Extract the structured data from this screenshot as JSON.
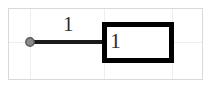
{
  "diagram": {
    "type": "block-diagram",
    "background_color": "#ffffff",
    "frame": {
      "name": "diagram-frame",
      "border_color": "#d9d9d9",
      "x": 8,
      "y": 8,
      "width": 195,
      "height": 72
    },
    "grid": {
      "visible": true,
      "color": "#eeeeee",
      "vertical_x": [
        30,
        104,
        172
      ],
      "horizontal_y": [
        42
      ]
    },
    "terminal": {
      "name": "terminal-node",
      "shape": "circle",
      "fill_color": "#808080",
      "stroke_color": "#4d4d4d",
      "cx": 30,
      "cy": 42,
      "r": 4
    },
    "edge": {
      "name": "connection-line",
      "label": "1",
      "color": "#1a1a1a",
      "thickness": 4,
      "x1": 30,
      "y1": 42,
      "x2": 104,
      "y2": 42,
      "label_x": 68,
      "label_y": 16
    },
    "block": {
      "name": "block-rectangle",
      "label": "1",
      "stroke_color": "#000000",
      "fill_color": "#ffffff",
      "stroke_width": 5,
      "x": 102,
      "y": 22,
      "width": 70,
      "height": 40,
      "label_x": 110,
      "label_y": 30
    }
  }
}
